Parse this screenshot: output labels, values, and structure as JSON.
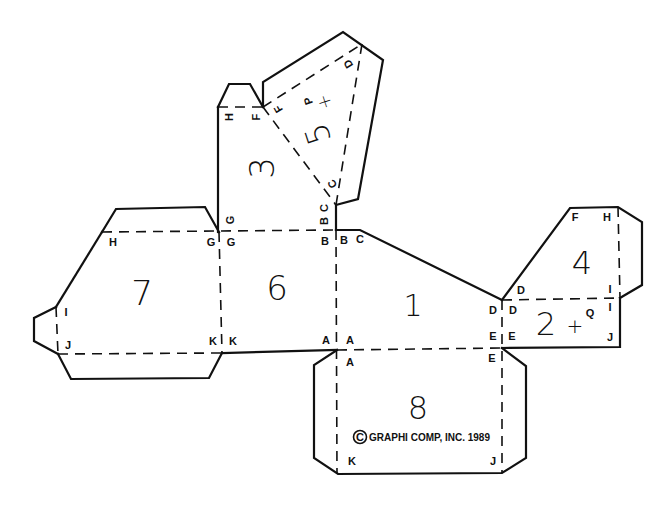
{
  "diagram": {
    "colors": {
      "background": "#ffffff",
      "ink": "#111111"
    },
    "panels": [
      {
        "id": "1",
        "label": "1"
      },
      {
        "id": "2",
        "label": "2"
      },
      {
        "id": "3",
        "label": "3"
      },
      {
        "id": "4",
        "label": "4"
      },
      {
        "id": "5",
        "label": "5"
      },
      {
        "id": "6",
        "label": "6"
      },
      {
        "id": "7",
        "label": "7"
      },
      {
        "id": "8",
        "label": "8"
      }
    ],
    "markers": {
      "panel2_plus": "+",
      "panel2_letter": "Q",
      "panel5_plus": "+",
      "panel5_letter": "P"
    },
    "vertex_labels": {
      "A": "A",
      "B": "B",
      "C": "C",
      "D": "D",
      "E": "E",
      "F": "F",
      "G": "G",
      "H": "H",
      "I": "I",
      "J": "J",
      "K": "K"
    },
    "copyright": "©GRAPHICOMP, INC. 1989",
    "copyright_parts": {
      "symbol": "©",
      "text": "GRAPHI COMP, INC. 1989"
    },
    "legend": {
      "solid_line": "cut line",
      "dashed_line": "fold line"
    }
  }
}
